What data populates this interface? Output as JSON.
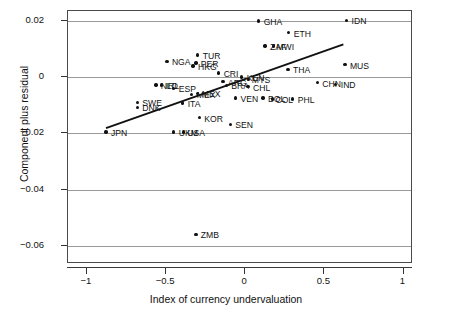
{
  "chart_data": {
    "type": "scatter",
    "title": "",
    "xlabel": "Index of currency undervaluation",
    "ylabel": "Component plus residual",
    "xlim": [
      -1.12,
      1.06
    ],
    "ylim": [
      -0.0665,
      0.0235
    ],
    "xticks": [
      -1,
      -0.5,
      0,
      0.5,
      1
    ],
    "xtick_labels": [
      "−1",
      "−0.5",
      "0",
      "0.5",
      "1"
    ],
    "yticks": [
      0.02,
      0,
      -0.02,
      -0.04,
      -0.06
    ],
    "ytick_labels": [
      "0.02",
      "0",
      "−0.02",
      "−0.04",
      "−0.06"
    ],
    "grid": "horizontal gridlines at each y tick",
    "legend": "none",
    "marker": "filled circle",
    "point_color": "#111111",
    "fit_line": {
      "label": "linear fit",
      "color": "#111111",
      "x0": -0.88,
      "y0": -0.0182,
      "x1": 0.62,
      "y1": 0.0116
    },
    "points": [
      {
        "label": "GHA",
        "x": 0.085,
        "y": 0.02,
        "label_dx": 5,
        "label_dy": -3
      },
      {
        "label": "IDN",
        "x": 0.64,
        "y": 0.0202,
        "label_dx": 5,
        "label_dy": -3
      },
      {
        "label": "ETH",
        "x": 0.275,
        "y": 0.0158,
        "label_dx": 5,
        "label_dy": -3
      },
      {
        "label": "ZAF",
        "x": 0.125,
        "y": 0.011,
        "label_dx": 5,
        "label_dy": -3
      },
      {
        "label": "MWI",
        "x": 0.178,
        "y": 0.011,
        "label_dx": 3,
        "label_dy": -3
      },
      {
        "label": "TUR",
        "x": -0.3,
        "y": 0.0078,
        "label_dx": 5,
        "label_dy": -3
      },
      {
        "label": "NGA",
        "x": -0.495,
        "y": 0.0056,
        "label_dx": 5,
        "label_dy": -3
      },
      {
        "label": "PER",
        "x": -0.312,
        "y": 0.005,
        "label_dx": 5,
        "label_dy": -3
      },
      {
        "label": "HKG",
        "x": -0.33,
        "y": 0.004,
        "label_dx": 5,
        "label_dy": -3
      },
      {
        "label": "MUS",
        "x": 0.63,
        "y": 0.0044,
        "label_dx": 5,
        "label_dy": -3
      },
      {
        "label": "THA",
        "x": 0.27,
        "y": 0.0028,
        "label_dx": 5,
        "label_dy": -3
      },
      {
        "label": "CRI",
        "x": -0.168,
        "y": 0.0014,
        "label_dx": 5,
        "label_dy": -3
      },
      {
        "label": "KEN",
        "x": -0.022,
        "y": 0.0,
        "label_dx": 5,
        "label_dy": -3
      },
      {
        "label": "MYS",
        "x": 0.022,
        "y": -0.0008,
        "label_dx": 3,
        "label_dy": -3
      },
      {
        "label": "ARG",
        "x": -0.14,
        "y": -0.0016,
        "label_dx": 5,
        "label_dy": -3
      },
      {
        "label": "BRA",
        "x": -0.12,
        "y": -0.003,
        "label_dx": 5,
        "label_dy": -3
      },
      {
        "label": "CHL",
        "x": 0.018,
        "y": -0.0034,
        "label_dx": 5,
        "label_dy": -3
      },
      {
        "label": "CHN",
        "x": 0.455,
        "y": -0.002,
        "label_dx": 5,
        "label_dy": -3
      },
      {
        "label": "IND",
        "x": 0.572,
        "y": -0.0026,
        "label_dx": 5,
        "label_dy": -3
      },
      {
        "label": "NLD",
        "x": -0.565,
        "y": -0.0028,
        "label_dx": 5,
        "label_dy": -3
      },
      {
        "label": "IRL",
        "x": -0.528,
        "y": -0.0028,
        "label_dx": 4,
        "label_dy": -3
      },
      {
        "label": "ESP",
        "x": -0.452,
        "y": -0.004,
        "label_dx": 5,
        "label_dy": -3
      },
      {
        "label": "MEX",
        "x": -0.338,
        "y": -0.0062,
        "label_dx": 5,
        "label_dy": -3
      },
      {
        "label": "JPN2",
        "x": -0.3,
        "y": -0.0058,
        "label_dx": 4,
        "label_dy": -3
      },
      {
        "label": "VEN",
        "x": -0.062,
        "y": -0.0074,
        "label_dx": 5,
        "label_dy": -3
      },
      {
        "label": "BOL",
        "x": 0.112,
        "y": -0.0074,
        "label_dx": 5,
        "label_dy": -3
      },
      {
        "label": "COL",
        "x": 0.172,
        "y": -0.0078,
        "label_dx": 3,
        "label_dy": -3
      },
      {
        "label": "PHL",
        "x": 0.3,
        "y": -0.0078,
        "label_dx": 5,
        "label_dy": -3
      },
      {
        "label": "ITA",
        "x": -0.395,
        "y": -0.0092,
        "label_dx": 5,
        "label_dy": -3
      },
      {
        "label": "SWE",
        "x": -0.682,
        "y": -0.009,
        "label_dx": 5,
        "label_dy": -3
      },
      {
        "label": "DNK",
        "x": -0.682,
        "y": -0.0108,
        "label_dx": 5,
        "label_dy": -3
      },
      {
        "label": "KOR",
        "x": -0.29,
        "y": -0.0144,
        "label_dx": 5,
        "label_dy": -3
      },
      {
        "label": "SEN",
        "x": -0.095,
        "y": -0.0168,
        "label_dx": 5,
        "label_dy": -3
      },
      {
        "label": "JPN",
        "x": -0.88,
        "y": -0.0196,
        "label_dx": 5,
        "label_dy": -3
      },
      {
        "label": "UKM",
        "x": -0.452,
        "y": -0.0196,
        "label_dx": 5,
        "label_dy": -3
      },
      {
        "label": "USA",
        "x": -0.392,
        "y": -0.0196,
        "label_dx": 4,
        "label_dy": -3
      },
      {
        "label": "ZMB",
        "x": -0.312,
        "y": -0.056,
        "label_dx": 5,
        "label_dy": -3
      }
    ],
    "label_overrides": {
      "JPN2": "MEX"
    }
  }
}
